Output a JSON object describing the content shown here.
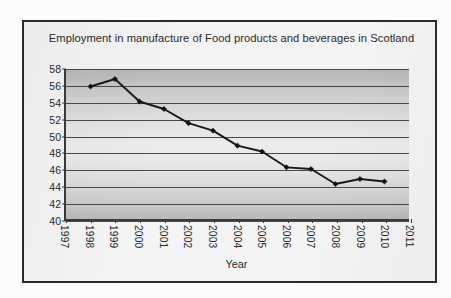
{
  "chart_data": {
    "type": "line",
    "title": "Employment in manufacture of Food products and beverages in Scotland",
    "xlabel": "Year",
    "ylabel": "",
    "xlim": [
      1997,
      2011
    ],
    "ylim": [
      40,
      58
    ],
    "ytick_step": 2,
    "grid": true,
    "legend": "none",
    "x_tick_labels": [
      "1997",
      "1998",
      "1999",
      "2000",
      "2001",
      "2002",
      "2003",
      "2004",
      "2005",
      "2006",
      "2007",
      "2008",
      "2009",
      "2010",
      "2011"
    ],
    "y_tick_labels": [
      "58",
      "56",
      "54",
      "52",
      "50",
      "48",
      "46",
      "44",
      "42",
      "40"
    ],
    "x": [
      1998,
      1999,
      2000,
      2001,
      2002,
      2003,
      2004,
      2005,
      2006,
      2007,
      2008,
      2009,
      2010
    ],
    "values": [
      55.9,
      56.8,
      54.1,
      53.2,
      51.5,
      50.6,
      48.8,
      48.1,
      46.2,
      46.0,
      44.2,
      44.8,
      44.5
    ],
    "series": [
      {
        "name": "Employment",
        "x": [
          1998,
          1999,
          2000,
          2001,
          2002,
          2003,
          2004,
          2005,
          2006,
          2007,
          2008,
          2009,
          2010
        ],
        "values": [
          55.9,
          56.8,
          54.1,
          53.2,
          51.5,
          50.6,
          48.8,
          48.1,
          46.2,
          46.0,
          44.2,
          44.8,
          44.5
        ],
        "line_color": "#1a1a1a",
        "marker": "diamond"
      }
    ],
    "colors": {
      "plot_background_top": "#b6b6b6",
      "plot_background_mid": "#ececec",
      "plot_background_bottom": "#b9b9b9",
      "gridline": "#4a4a4a",
      "axis": "#3a3a3a",
      "border": "#2b2b2b",
      "page_background": "#fdfdfd",
      "text": "#2a2a2a"
    }
  }
}
